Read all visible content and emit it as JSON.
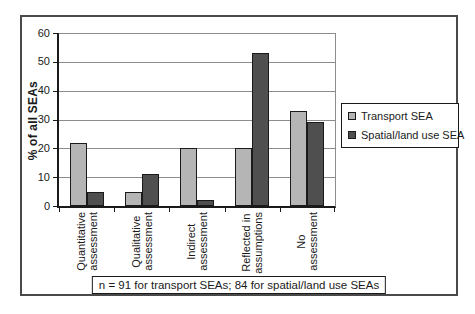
{
  "figure": {
    "note": "n = 91 for transport SEAs; 84 for spatial/land use SEAs"
  },
  "chart_data": {
    "type": "bar",
    "title": "",
    "xlabel": "",
    "ylabel": "% of all SEAs",
    "ylim": [
      0,
      60
    ],
    "yticks": [
      0,
      10,
      20,
      30,
      40,
      50,
      60
    ],
    "grid": true,
    "legend_position": "right",
    "categories": [
      "Quantitative\nassessment",
      "Qualitative\nassessment",
      "Indirect\nassessment",
      "Reflected in\nassumptions",
      "No\nassessment"
    ],
    "series": [
      {
        "name": "Transport SEA",
        "color": "#b5b5b5",
        "values": [
          22,
          5,
          20,
          20,
          33
        ]
      },
      {
        "name": "Spatial/land use SEA",
        "color": "#4f4f4f",
        "values": [
          5,
          11,
          2,
          53,
          29
        ]
      }
    ],
    "colors": {
      "axis": "#1a1a1a",
      "gridline": "#8c8c8c",
      "bar_border": "#1a1a1a"
    }
  }
}
